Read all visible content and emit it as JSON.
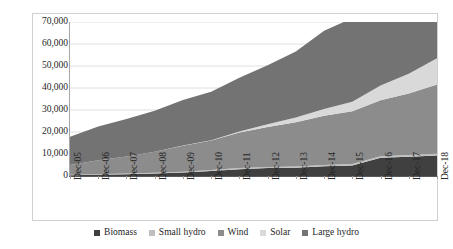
{
  "chart_data": {
    "type": "area",
    "title": "",
    "subtitle": "",
    "xlabel": "",
    "ylabel": "",
    "stacked": true,
    "grid": true,
    "legend_position": "bottom",
    "ylim": [
      0,
      70000
    ],
    "ytick_labels": [
      "70,000",
      "60,000",
      "50,000",
      "40,000",
      "30,000",
      "20,000",
      "10,000",
      "0"
    ],
    "ytick_values": [
      70000,
      60000,
      50000,
      40000,
      30000,
      20000,
      10000,
      0
    ],
    "categories": [
      "Dec-05",
      "Dec-06",
      "Dec-07",
      "Dec-08",
      "Dec-09",
      "Dec-10",
      "Dec-11",
      "Dec-12",
      "Dec-13",
      "Dec-14",
      "Dec-15",
      "Dec-16",
      "Dec-17",
      "Dec-18"
    ],
    "series": [
      {
        "name": "Biomass",
        "color": "#404040",
        "values": [
          390,
          580,
          780,
          1100,
          1600,
          2300,
          3100,
          3600,
          3800,
          4400,
          4800,
          8300,
          8800,
          9300
        ]
      },
      {
        "name": "Small hydro",
        "color": "#bfbfbf",
        "values": [
          220,
          260,
          300,
          340,
          380,
          430,
          480,
          520,
          560,
          600,
          640,
          680,
          720,
          760
        ]
      },
      {
        "name": "Wind",
        "color": "#8c8c8c",
        "values": [
          4400,
          6300,
          7800,
          9600,
          11800,
          13400,
          16200,
          18200,
          20100,
          22400,
          24000,
          25400,
          28000,
          31500
        ]
      },
      {
        "name": "Solar",
        "color": "#d9d9d9",
        "values": [
          10,
          10,
          20,
          30,
          40,
          80,
          500,
          1200,
          2100,
          3100,
          4300,
          6700,
          9000,
          12000
        ]
      },
      {
        "name": "Large hydro",
        "color": "#737373",
        "values": [
          12800,
          15400,
          17000,
          18600,
          20700,
          22100,
          24400,
          26800,
          30000,
          35500,
          38000,
          39500,
          40500,
          41300
        ]
      }
    ],
    "totals": [
      13000,
      16000,
      18000,
      20000,
      22500,
      24500,
      29000,
      32500,
      36500,
      43000,
      47000,
      50500,
      55000,
      58000
    ]
  },
  "legend": {
    "items": [
      {
        "label": "Biomass",
        "color": "#404040"
      },
      {
        "label": "Small hydro",
        "color": "#bfbfbf"
      },
      {
        "label": "Wind",
        "color": "#8c8c8c"
      },
      {
        "label": "Solar",
        "color": "#d9d9d9"
      },
      {
        "label": "Large hydro",
        "color": "#737373"
      }
    ]
  },
  "axis": {
    "gridline_color": "#e0e0e0",
    "axis_color": "#595959",
    "label_color": "#262626"
  }
}
